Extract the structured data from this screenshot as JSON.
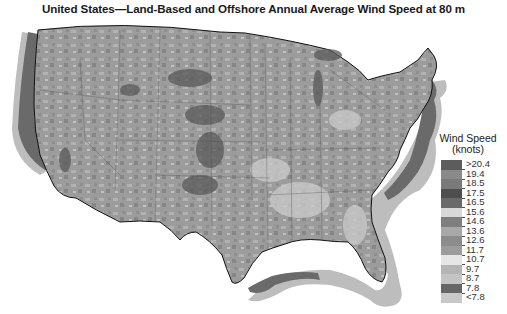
{
  "title": "United States—Land-Based and Offshore Annual Average Wind Speed at 80 m",
  "legend": {
    "title_line1": "Wind Speed",
    "title_line2": "(knots)",
    "items": [
      {
        "label": ">20.4",
        "color": "#5c5c5c"
      },
      {
        "label": "19.4",
        "color": "#8a8a8a"
      },
      {
        "label": "18.5",
        "color": "#7a7a7a"
      },
      {
        "label": "17.5",
        "color": "#4e4e4e"
      },
      {
        "label": "16.5",
        "color": "#6a6a6a"
      },
      {
        "label": "15.6",
        "color": "#d8d8d8"
      },
      {
        "label": "14.6",
        "color": "#7e7e7e"
      },
      {
        "label": "13.6",
        "color": "#a8a8a8"
      },
      {
        "label": "12.6",
        "color": "#8c8c8c"
      },
      {
        "label": "11.7",
        "color": "#9c9c9c"
      },
      {
        "label": "10.7",
        "color": "#e6e6e6"
      },
      {
        "label": "9.7",
        "color": "#b4b4b4"
      },
      {
        "label": "8.7",
        "color": "#c4c4c4"
      },
      {
        "label": "7.8",
        "color": "#666666"
      },
      {
        "label": "<7.8",
        "color": "#c8c8c8"
      }
    ]
  },
  "map": {
    "land_color": "#9a9a9a",
    "offshore_near_color": "#6e6e6e",
    "offshore_far_color": "#b8b8b8",
    "coastline_color": "#111111",
    "state_line_color": "#555555"
  }
}
